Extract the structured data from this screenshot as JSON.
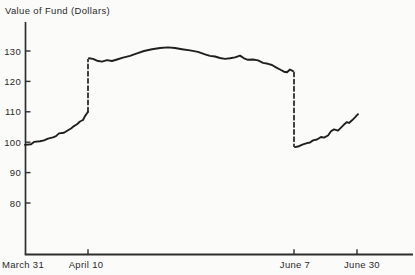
{
  "colors": {
    "line": "#1f1f1f",
    "axis": "#2e2e2e",
    "text": "#2a2a2a",
    "background": "#fbfbfa"
  },
  "chart_data": {
    "type": "line",
    "title": "Value of Fund (Dollars)",
    "xlabel": "",
    "ylabel": "Value of Fund (Dollars)",
    "ylim": [
      80,
      130
    ],
    "grid": false,
    "legend": "none",
    "y_ticks": [
      130,
      120,
      110,
      100,
      90,
      80
    ],
    "x_ticks": [
      {
        "label": "March 31",
        "tick_x": null,
        "label_x": 23
      },
      {
        "label": "April 10",
        "tick_x": 88,
        "label_x": 86
      },
      {
        "label": "June 7",
        "tick_x": 294,
        "label_x": 295
      },
      {
        "label": "June 30",
        "tick_x": 357,
        "label_x": 362
      }
    ],
    "key_points": {
      "start": {
        "date": "March 31",
        "value": 100
      },
      "before_jump": {
        "date": "April 10",
        "value": 110
      },
      "after_jump": {
        "date": "April 10",
        "value": 127.5
      },
      "peak": {
        "date": "mid-May",
        "value": 131
      },
      "before_drop": {
        "date": "June 7",
        "value": 123
      },
      "after_drop": {
        "date": "June 7",
        "value": 99
      },
      "end": {
        "date": "June 30",
        "value": 109.5
      }
    },
    "series": [
      {
        "name": "fund-value-pre-jump",
        "style": "solid",
        "points": [
          [
            25,
            99.1
          ],
          [
            31,
            99.3
          ],
          [
            34,
            100.1
          ],
          [
            40,
            100.3
          ],
          [
            44,
            100.6
          ],
          [
            48,
            101.2
          ],
          [
            53,
            101.6
          ],
          [
            56,
            102.0
          ],
          [
            59,
            102.9
          ],
          [
            64,
            103.1
          ],
          [
            68,
            103.9
          ],
          [
            71,
            104.5
          ],
          [
            74,
            105.3
          ],
          [
            77,
            105.9
          ],
          [
            80,
            106.8
          ],
          [
            83,
            107.3
          ],
          [
            85,
            108.6
          ],
          [
            87,
            109.5
          ],
          [
            88,
            110.0
          ]
        ]
      },
      {
        "name": "jump-april-10",
        "style": "dashed",
        "points": [
          [
            88,
            110.0
          ],
          [
            88,
            127.2
          ]
        ]
      },
      {
        "name": "fund-value-mid",
        "style": "solid",
        "points": [
          [
            89,
            127.6
          ],
          [
            93,
            127.4
          ],
          [
            97,
            126.8
          ],
          [
            102,
            126.5
          ],
          [
            107,
            127.0
          ],
          [
            112,
            126.7
          ],
          [
            117,
            127.2
          ],
          [
            123,
            127.8
          ],
          [
            130,
            128.4
          ],
          [
            137,
            129.2
          ],
          [
            144,
            130.0
          ],
          [
            152,
            130.6
          ],
          [
            160,
            131.0
          ],
          [
            168,
            131.2
          ],
          [
            175,
            131.0
          ],
          [
            182,
            130.6
          ],
          [
            190,
            130.2
          ],
          [
            198,
            129.7
          ],
          [
            205,
            128.9
          ],
          [
            210,
            128.4
          ],
          [
            215,
            128.2
          ],
          [
            220,
            127.7
          ],
          [
            225,
            127.4
          ],
          [
            230,
            127.6
          ],
          [
            235,
            127.9
          ],
          [
            240,
            128.5
          ],
          [
            244,
            127.6
          ],
          [
            248,
            127.1
          ],
          [
            253,
            127.2
          ],
          [
            258,
            126.9
          ],
          [
            263,
            126.1
          ],
          [
            268,
            125.8
          ],
          [
            272,
            125.4
          ],
          [
            276,
            124.6
          ],
          [
            280,
            123.9
          ],
          [
            284,
            123.2
          ],
          [
            287,
            123.0
          ],
          [
            290,
            123.9
          ],
          [
            293,
            123.4
          ]
        ]
      },
      {
        "name": "drop-june-7",
        "style": "dashed",
        "points": [
          [
            294,
            123.0
          ],
          [
            294,
            98.7
          ]
        ]
      },
      {
        "name": "fund-value-post-drop",
        "style": "solid",
        "points": [
          [
            295,
            98.4
          ],
          [
            299,
            98.7
          ],
          [
            303,
            99.3
          ],
          [
            307,
            99.7
          ],
          [
            310,
            99.9
          ],
          [
            313,
            100.6
          ],
          [
            317,
            100.9
          ],
          [
            321,
            101.7
          ],
          [
            324,
            101.5
          ],
          [
            328,
            102.2
          ],
          [
            331,
            103.6
          ],
          [
            334,
            104.2
          ],
          [
            338,
            103.8
          ],
          [
            341,
            104.8
          ],
          [
            344,
            105.8
          ],
          [
            347,
            106.6
          ],
          [
            349,
            106.3
          ],
          [
            352,
            107.2
          ],
          [
            355,
            108.2
          ],
          [
            357,
            108.9
          ],
          [
            358,
            109.2
          ]
        ]
      }
    ]
  }
}
